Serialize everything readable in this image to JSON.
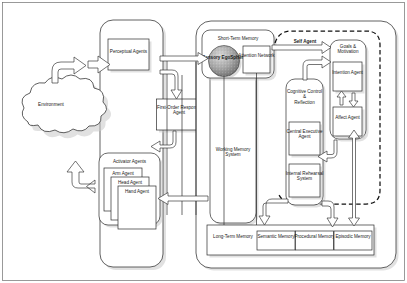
{
  "diagram": {
    "type": "block-diagram",
    "colors": {
      "background": "#ffffff",
      "stroke": "#2b2b2b",
      "shadow": "#c9c9c9",
      "dashed_boundary": "#111111",
      "sphere_fill": "#9a9a9a"
    }
  },
  "environment": {
    "label": "Environment"
  },
  "robot": {
    "perceptual_agents": {
      "label": "Perceptual Agents"
    },
    "first_order_response_agent": {
      "label": "First-Order Response Agent"
    },
    "activator_agents": {
      "label": "Activator Agents",
      "agents": [
        {
          "label": "Arm Agent"
        },
        {
          "label": "Head Agent"
        },
        {
          "label": "Hand Agent"
        }
      ]
    }
  },
  "cognition": {
    "short_term_memory": {
      "label": "Short-Term Memory",
      "sensory_egosphere": {
        "label": "Sensory EgoSphere"
      },
      "attention_network": {
        "label": "Attention Network"
      }
    },
    "working_memory_system": {
      "label": "Working Memory System"
    },
    "self_agent": {
      "label": "Self Agent",
      "cognitive_control": {
        "label": "Cognitive Control & Reflection",
        "central_executive_agent": {
          "label": "Central Executive Agent"
        },
        "internal_rehearsal_system": {
          "label": "Internal Rehearsal System"
        }
      },
      "goals_motivation": {
        "label": "Goals & Motivation",
        "intention_agent": {
          "label": "Intention Agent"
        },
        "affect_agent": {
          "label": "Affect Agent"
        }
      }
    },
    "long_term_memory": {
      "label": "Long-Term Memory",
      "stores": [
        {
          "label": "Semantic Memory"
        },
        {
          "label": "Procedural Memory"
        },
        {
          "label": "Episodic Memory"
        }
      ]
    }
  }
}
